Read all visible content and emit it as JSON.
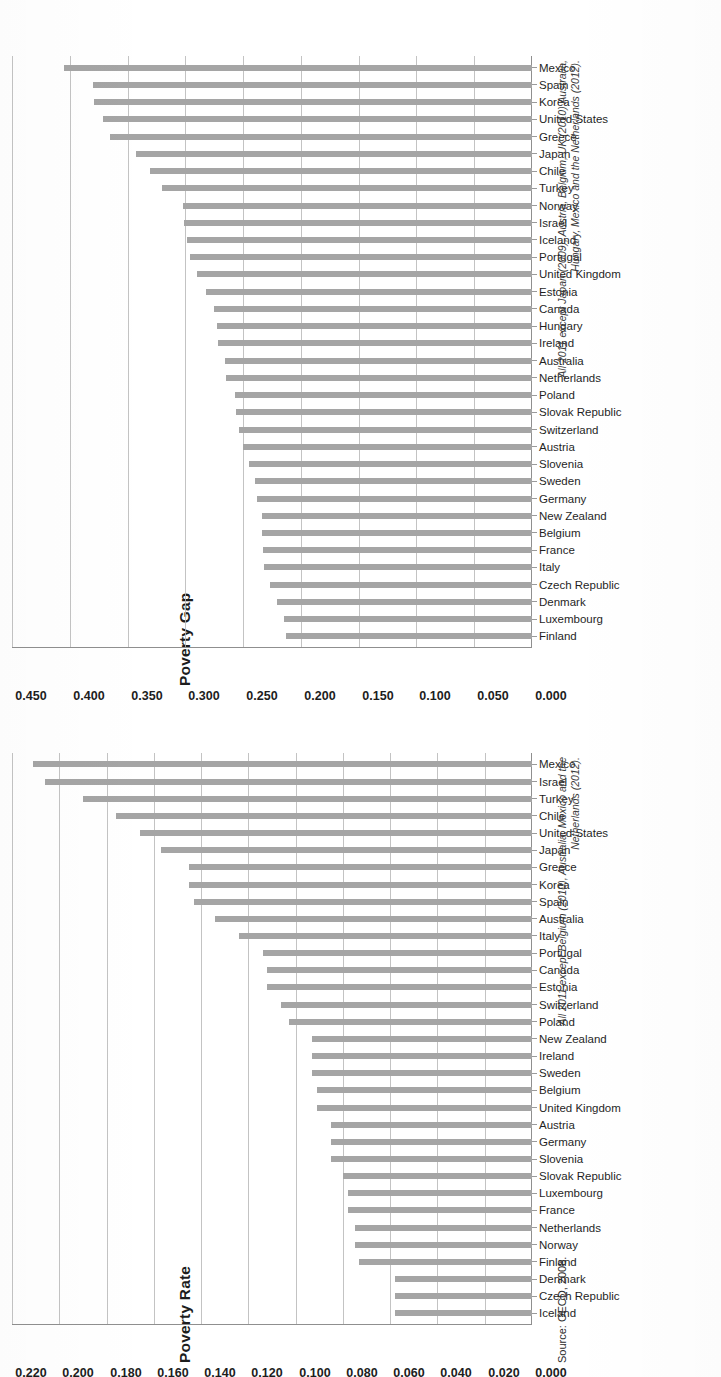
{
  "document": {
    "source_line": "Source: OECD, 2008."
  },
  "charts": [
    {
      "key": "gap",
      "title": "Poverty Gap",
      "note": "All 2011 except Japan (2009), Austria, Belgium, UK (2010) Australia, Hungary, Mexico and the Netherlands (2012).",
      "axis_ticks": [
        "0.000",
        "0.050",
        "0.100",
        "0.150",
        "0.200",
        "0.250",
        "0.300",
        "0.350",
        "0.400",
        "0.450"
      ]
    },
    {
      "key": "rate",
      "title": "Poverty Rate",
      "note": "All 2011 except Belgium (2010), Australia, Mexico and the Netherlands (2012).",
      "axis_ticks": [
        "0.000",
        "0.020",
        "0.040",
        "0.060",
        "0.080",
        "0.100",
        "0.120",
        "0.140",
        "0.160",
        "0.180",
        "0.200",
        "0.220"
      ]
    }
  ],
  "chart_data": [
    {
      "type": "bar",
      "key": "gap",
      "title": "Poverty Gap",
      "xlabel": "",
      "ylabel": "",
      "ylim": [
        0,
        0.45
      ],
      "ytick_step": 0.05,
      "grid": true,
      "legend": "none",
      "orientation": "vertical",
      "annotation": "All 2011 except Japan (2009), Austria, Belgium, UK (2010) Australia, Hungary, Mexico and the Netherlands (2012).",
      "categories": [
        "Finland",
        "Luxembourg",
        "Denmark",
        "Czech Republic",
        "Italy",
        "France",
        "Belgium",
        "New Zealand",
        "Germany",
        "Sweden",
        "Slovenia",
        "Austria",
        "Switzerland",
        "Slovak Republic",
        "Poland",
        "Netherlands",
        "Australia",
        "Ireland",
        "Hungary",
        "Canada",
        "Estonia",
        "United Kingdom",
        "Portugal",
        "Iceland",
        "Israel",
        "Norway",
        "Turkey",
        "Chile",
        "Japan",
        "Greece",
        "United States",
        "Korea",
        "Spain",
        "Mexico"
      ],
      "values": [
        0.213,
        0.215,
        0.221,
        0.227,
        0.232,
        0.233,
        0.234,
        0.234,
        0.238,
        0.24,
        0.245,
        0.25,
        0.254,
        0.256,
        0.257,
        0.265,
        0.266,
        0.272,
        0.273,
        0.275,
        0.282,
        0.29,
        0.296,
        0.299,
        0.301,
        0.302,
        0.32,
        0.331,
        0.343,
        0.365,
        0.371,
        0.379,
        0.38,
        0.405
      ]
    },
    {
      "type": "bar",
      "key": "rate",
      "title": "Poverty Rate",
      "xlabel": "",
      "ylabel": "",
      "ylim": [
        0,
        0.22
      ],
      "ytick_step": 0.02,
      "grid": true,
      "legend": "none",
      "orientation": "vertical",
      "annotation": "All 2011 except Belgium (2010), Australia, Mexico and the Netherlands (2012).",
      "categories": [
        "Iceland",
        "Czech Republic",
        "Denmark",
        "Finland",
        "Norway",
        "Netherlands",
        "France",
        "Luxembourg",
        "Slovak Republic",
        "Slovenia",
        "Germany",
        "Austria",
        "United Kingdom",
        "Belgium",
        "Sweden",
        "Ireland",
        "New Zealand",
        "Poland",
        "Switzerland",
        "Estonia",
        "Canada",
        "Portugal",
        "Italy",
        "Australia",
        "Spain",
        "Korea",
        "Greece",
        "Japan",
        "United States",
        "Chile",
        "Turkey",
        "Israel",
        "Mexico"
      ],
      "values": [
        0.058,
        0.058,
        0.058,
        0.073,
        0.075,
        0.075,
        0.078,
        0.078,
        0.08,
        0.085,
        0.085,
        0.085,
        0.091,
        0.091,
        0.093,
        0.093,
        0.093,
        0.103,
        0.106,
        0.112,
        0.112,
        0.114,
        0.124,
        0.134,
        0.143,
        0.145,
        0.145,
        0.157,
        0.166,
        0.176,
        0.19,
        0.206,
        0.211
      ]
    }
  ]
}
